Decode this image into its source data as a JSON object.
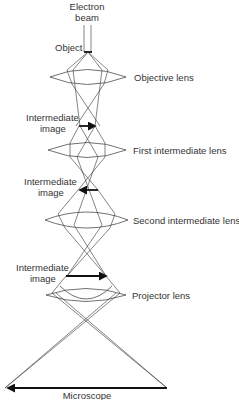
{
  "diagram": {
    "labels": {
      "electron_beam_line1": "Electron",
      "electron_beam_line2": "beam",
      "object": "Object",
      "objective_lens": "Objective lens",
      "intermediate_image_1_line1": "Intermediate",
      "intermediate_image_1_line2": "image",
      "first_intermediate_lens": "First intermediate lens",
      "intermediate_image_2_line1": "Intermediate",
      "intermediate_image_2_line2": "image",
      "second_intermediate_lens": "Second intermediate lens",
      "intermediate_image_3_line1": "Intermediate",
      "intermediate_image_3_line2": "image",
      "projector_lens": "Projector lens",
      "final_image": "Microscope"
    },
    "colors": {
      "line": "#333333",
      "image_arrow": "#111111",
      "background": "#ffffff"
    }
  }
}
